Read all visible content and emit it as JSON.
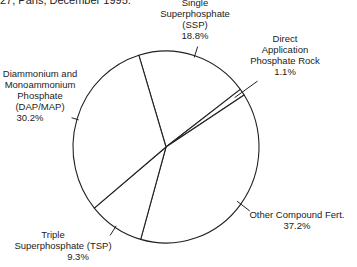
{
  "caption": "27, Paris, December 1995.",
  "chart_data": {
    "type": "pie",
    "title": "",
    "start_boundary": "between Diammonium and Monoammonium Phosphate and Single Superphosphate, upper-left",
    "direction": "clockwise",
    "slices": [
      {
        "name": "Single Superphosphate (SSP)",
        "label_lines": [
          "Single",
          "Superphosphate",
          "(SSP)"
        ],
        "value": 18.8,
        "value_label": "18.8%"
      },
      {
        "name": "Direct Application Phosphate Rock",
        "label_lines": [
          "Direct",
          "Application",
          "Phosphate Rock"
        ],
        "value": 1.1,
        "value_label": "1.1%"
      },
      {
        "name": "Other Compound Fert.",
        "label_lines": [
          "Other Compound Fert."
        ],
        "value": 37.2,
        "value_label": "37.2%"
      },
      {
        "name": "Triple Superphosphate (TSP)",
        "label_lines": [
          "Triple",
          "Superphosphate (TSP)"
        ],
        "value": 9.3,
        "value_label": "9.3%"
      },
      {
        "name": "Diammonium and Monoammonium Phosphate (DAP/MAP)",
        "label_lines": [
          "Diammonium and",
          "Monoammonium",
          "Phosphate",
          "(DAP/MAP)"
        ],
        "value": 30.2,
        "value_label": "30.2%"
      }
    ],
    "fill": "#ffffff",
    "stroke": "#222222"
  }
}
